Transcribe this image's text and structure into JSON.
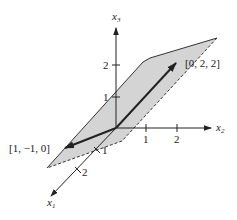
{
  "diagram": {
    "type": "3d-coordinate-plane",
    "axes": {
      "x1": {
        "label": "x",
        "subscript": "1",
        "ticks": [
          "1",
          "2"
        ]
      },
      "x2": {
        "label": "x",
        "subscript": "2",
        "ticks": [
          "1",
          "2"
        ]
      },
      "x3": {
        "label": "x",
        "subscript": "3",
        "ticks": [
          "1",
          "2"
        ]
      }
    },
    "vectors": [
      {
        "label": "[0, 2, 2]",
        "components": [
          0,
          2,
          2
        ]
      },
      {
        "label": "[1, −1, 0]",
        "components": [
          1,
          -1,
          0
        ]
      }
    ],
    "plane": {
      "description": "plane spanned by the two vectors",
      "fill": "#d4d4d4"
    },
    "colors": {
      "axis": "#222222",
      "plane_fill": "#d4d4d4",
      "plane_edge": "#333333",
      "vector": "#222222"
    }
  }
}
